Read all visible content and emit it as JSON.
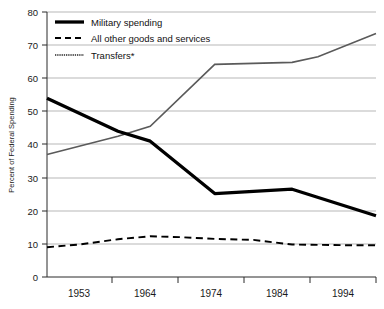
{
  "chart_data": {
    "type": "line",
    "title": "",
    "xlabel": "",
    "ylabel": "Percent of Federal Spending",
    "ylim": [
      0,
      80
    ],
    "ytick_labels": [
      "0",
      "10",
      "20",
      "30",
      "40",
      "50",
      "60",
      "70",
      "80"
    ],
    "yticks": [
      0,
      10,
      20,
      30,
      40,
      50,
      60,
      70,
      80
    ],
    "xtick_labels": [
      "1953",
      "1964",
      "1974",
      "1984",
      "1994"
    ],
    "xticks": [
      1953,
      1964,
      1974,
      1984,
      1994
    ],
    "xlim": [
      1948,
      1999
    ],
    "grid": "horizontal",
    "legend_position": "top-left",
    "series": [
      {
        "name": "Military spending",
        "style": "solid-thick",
        "color": "#000000",
        "x": [
          1948,
          1959,
          1964,
          1974,
          1986,
          1999
        ],
        "values": [
          54.0,
          44.0,
          41.0,
          25.2,
          26.5,
          18.5
        ]
      },
      {
        "name": "All other goods and services",
        "style": "dashed",
        "color": "#000000",
        "x": [
          1948,
          1953,
          1959,
          1964,
          1969,
          1974,
          1980,
          1986,
          1994,
          1999
        ],
        "values": [
          9.0,
          9.8,
          11.4,
          12.3,
          12.0,
          11.5,
          11.2,
          9.8,
          9.6,
          9.6
        ]
      },
      {
        "name": "Transfers*",
        "style": "thin-hatched",
        "color": "#5a5a5a",
        "x": [
          1948,
          1959,
          1964,
          1974,
          1986,
          1990,
          1999
        ],
        "values": [
          37.0,
          42.5,
          45.5,
          64.2,
          64.8,
          66.5,
          73.5
        ]
      }
    ]
  },
  "legend": {
    "items": [
      {
        "label": "Military spending",
        "swatch": "solid-thick-line-swatch"
      },
      {
        "label": "All other goods and services",
        "swatch": "dashed-line-swatch"
      },
      {
        "label": "Transfers*",
        "swatch": "thin-hatched-line-swatch"
      }
    ]
  },
  "axes": {
    "y_axis_title": "Percent of Federal Spending"
  }
}
